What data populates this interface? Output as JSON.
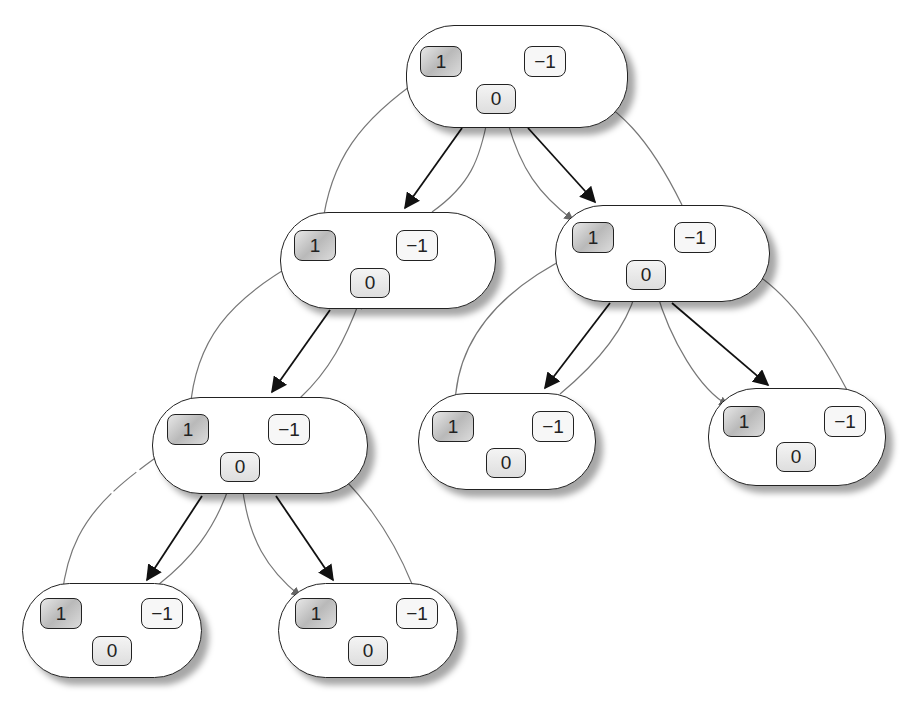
{
  "diagram": {
    "type": "binary tree of nodes, each holding three pointer cells",
    "cell_labels": {
      "positive": "1",
      "zero": "0",
      "negative": "−1"
    },
    "colors": {
      "node_border": "#222222",
      "tree_edge": "#111111",
      "thread_edge": "#777777",
      "positive_cell_fill": "#c4c4c4",
      "shadow": "#9a9a9a"
    },
    "nodes": [
      {
        "id": "root",
        "level": 0,
        "one": "1",
        "zero": "0",
        "neg": "−1"
      },
      {
        "id": "l1-left",
        "level": 1,
        "one": "1",
        "zero": "0",
        "neg": "−1"
      },
      {
        "id": "l1-right",
        "level": 1,
        "one": "1",
        "zero": "0",
        "neg": "−1"
      },
      {
        "id": "l2-left",
        "level": 2,
        "one": "1",
        "zero": "0",
        "neg": "−1"
      },
      {
        "id": "l2-mid",
        "level": 2,
        "one": "1",
        "zero": "0",
        "neg": "−1"
      },
      {
        "id": "l2-right",
        "level": 2,
        "one": "1",
        "zero": "0",
        "neg": "−1"
      },
      {
        "id": "l3-left",
        "level": 3,
        "one": "1",
        "zero": "0",
        "neg": "−1"
      },
      {
        "id": "l3-right",
        "level": 3,
        "one": "1",
        "zero": "0",
        "neg": "−1"
      }
    ],
    "tree_edges": [
      [
        "root",
        "l1-left"
      ],
      [
        "root",
        "l1-right"
      ],
      [
        "l1-left",
        "l2-left"
      ],
      [
        "l1-right",
        "l2-mid"
      ],
      [
        "l1-right",
        "l2-right"
      ],
      [
        "l2-left",
        "l3-left"
      ],
      [
        "l2-left",
        "l3-right"
      ]
    ]
  }
}
